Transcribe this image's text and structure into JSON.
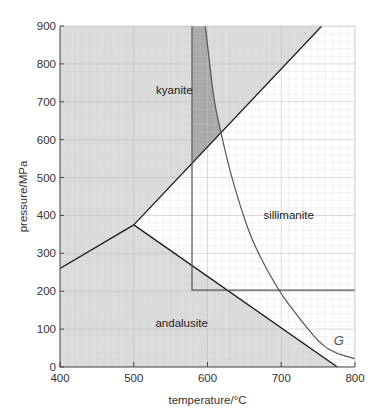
{
  "chart_data": {
    "type": "line",
    "title": "",
    "xlabel": "temperature/°C",
    "ylabel": "pressure/MPa",
    "xlim": [
      400,
      800
    ],
    "ylim": [
      0,
      900
    ],
    "xticks": [
      400,
      500,
      600,
      700,
      800
    ],
    "yticks": [
      0,
      100,
      200,
      300,
      400,
      500,
      600,
      700,
      800,
      900
    ],
    "grid": true,
    "legend": "none",
    "colors": {
      "kyanite_andalusite_fill": "#dcdcdc",
      "overlap_band_fill": "#a9a9a9",
      "sillimanite_fill": "#ffffff",
      "phase_line": "#1a1a1a",
      "curve_G": "#555555",
      "box_line": "#555555"
    },
    "series": [
      {
        "name": "kyanite-andalusite boundary",
        "points": [
          [
            400,
            260
          ],
          [
            500,
            375
          ]
        ]
      },
      {
        "name": "kyanite-sillimanite boundary",
        "points": [
          [
            500,
            375
          ],
          [
            755,
            900
          ]
        ]
      },
      {
        "name": "andalusite-sillimanite boundary",
        "points": [
          [
            500,
            375
          ],
          [
            776,
            0
          ]
        ]
      },
      {
        "name": "G",
        "points": [
          [
            597,
            900
          ],
          [
            603,
            800
          ],
          [
            609,
            700
          ],
          [
            618,
            620
          ],
          [
            630,
            520
          ],
          [
            645,
            420
          ],
          [
            663,
            320
          ],
          [
            696,
            203
          ],
          [
            720,
            140
          ],
          [
            753,
            60
          ],
          [
            775,
            35
          ],
          [
            800,
            22
          ]
        ]
      },
      {
        "name": "reaction box",
        "points": [
          [
            579,
            900
          ],
          [
            579,
            203
          ],
          [
            800,
            203
          ]
        ]
      }
    ],
    "triple_point": [
      500,
      375
    ],
    "regions": [
      {
        "name": "kyanite",
        "label_at": [
          555,
          720
        ]
      },
      {
        "name": "sillimanite",
        "label_at": [
          710,
          390
        ]
      },
      {
        "name": "andalusite",
        "label_at": [
          565,
          105
        ]
      }
    ],
    "annotations": [
      {
        "text": "G",
        "at": [
          778,
          58
        ]
      }
    ]
  }
}
